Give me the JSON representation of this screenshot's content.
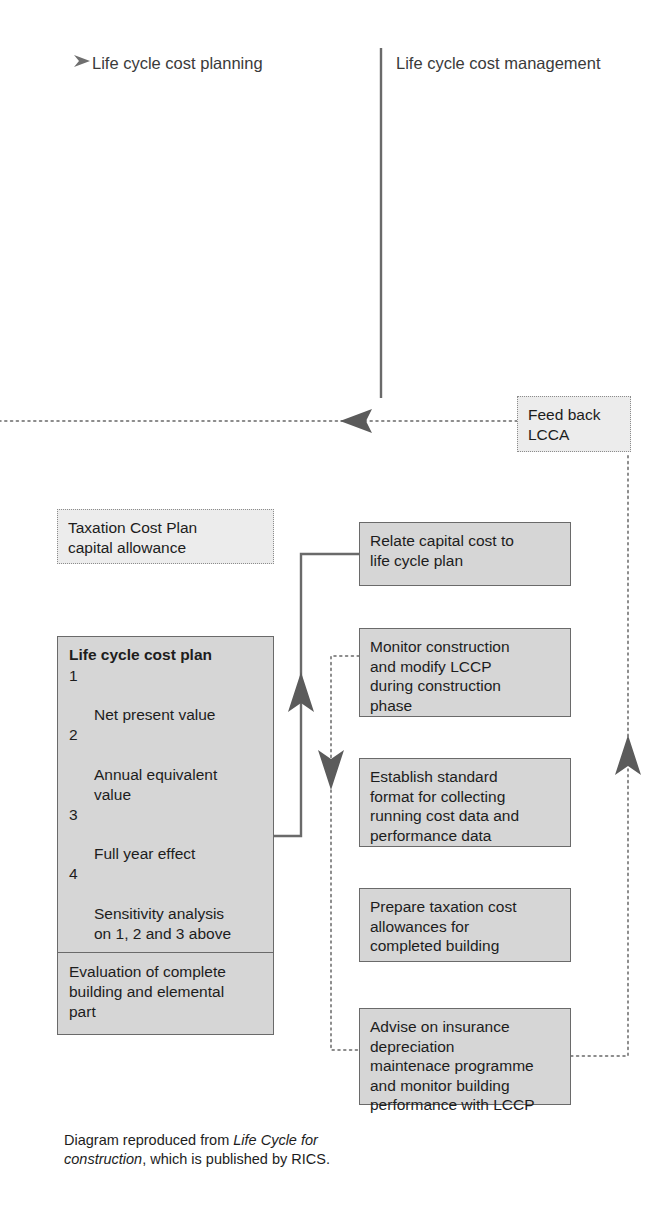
{
  "columns": {
    "left_header": "Life cycle cost planning",
    "right_header": "Life cycle cost management"
  },
  "icons": {
    "left_header_arrow": "arrow-right-icon"
  },
  "colors": {
    "box_fill": "#d6d6d6",
    "box_border": "#6a6a6a",
    "dotted_box_fill": "#ececec",
    "dotted_box_border": "#8c8c8c",
    "connector": "#6a6a6a",
    "text": "#1d1d1d"
  },
  "boxes": {
    "feedback": {
      "text": "Feed back\nLCCA",
      "style": "dotted"
    },
    "taxation": {
      "text": "Taxation Cost Plan\ncapital allowance",
      "style": "dotted"
    },
    "life_cycle_cost_plan": {
      "title": "Life cycle cost plan",
      "items": [
        {
          "num": "1",
          "text": "Net present value"
        },
        {
          "num": "2",
          "text": "Annual equivalent\nvalue"
        },
        {
          "num": "3",
          "text": "Full year effect"
        },
        {
          "num": "4",
          "text": "Sensitivity analysis\non 1, 2 and 3 above"
        }
      ],
      "footer": "Evaluation of complete\nbuilding and elemental\npart"
    },
    "relate": {
      "text": "Relate capital cost to\nlife cycle plan",
      "style": "solid"
    },
    "monitor": {
      "text": "Monitor construction\nand modify LCCP\nduring construction\nphase",
      "style": "solid"
    },
    "establish": {
      "text": "Establish standard\nformat for collecting\nrunning cost data and\nperformance data",
      "style": "solid"
    },
    "prepare": {
      "text": "Prepare taxation cost\nallowances for\ncompleted building",
      "style": "solid"
    },
    "advise": {
      "text": "Advise on insurance\ndepreciation\nmaintenace programme\nand monitor building\nperformance with LCCP",
      "style": "solid"
    }
  },
  "connectors": [
    {
      "name": "column-divider-vertical",
      "style": "solid"
    },
    {
      "name": "feedback-dotted-horizontal",
      "style": "dotted",
      "arrow": "left"
    },
    {
      "name": "relate-to-evaluation-solid",
      "style": "solid",
      "arrow": "up"
    },
    {
      "name": "monitor-to-establish-dotted",
      "style": "dotted",
      "arrow": "down"
    },
    {
      "name": "advise-to-feedback-dotted",
      "style": "dotted",
      "arrow": "up"
    }
  ],
  "caption": {
    "before": "Diagram reproduced from ",
    "italic": "Life Cycle for construction",
    "after": ", which is published by RICS."
  }
}
